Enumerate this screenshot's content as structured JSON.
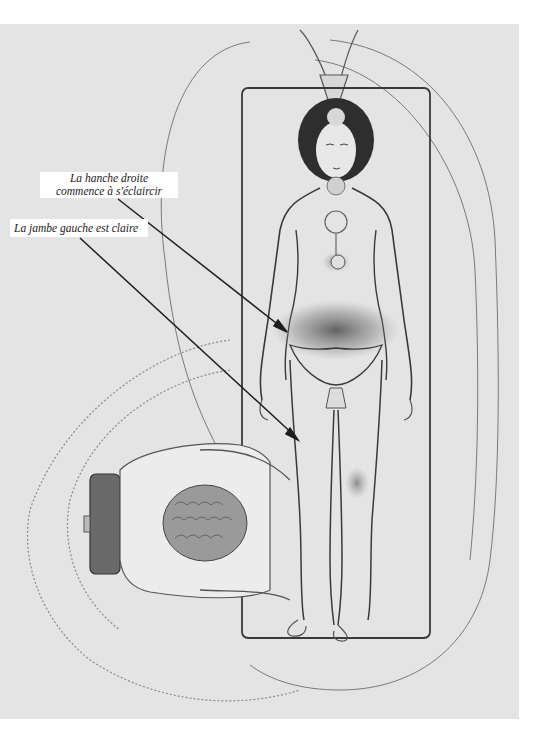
{
  "illustration": {
    "background_color": "#e4e4e4",
    "line_color": "#3a3a3a",
    "subjects": [
      "reclining-woman",
      "kneeling-healer",
      "treatment-table",
      "aura-field"
    ]
  },
  "annotations": [
    {
      "id": "hip",
      "lines": [
        "La hanche droite",
        "commence à s'éclaircir"
      ],
      "line_1": "La hanche droite",
      "line_2": "commence à s'éclaircir"
    },
    {
      "id": "leg",
      "text": "La jambe gauche est claire"
    }
  ]
}
